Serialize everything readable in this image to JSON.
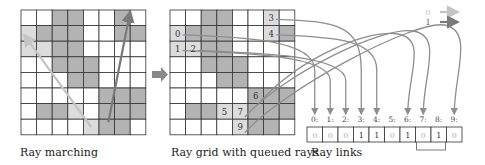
{
  "colors": {
    "cell_empty": "#ffffff",
    "cell_filled": "#b3b3b3",
    "cell_light": "#dcdcdc",
    "cell_dark": "#a8a8a8",
    "grid_line": "#333333",
    "ray0": "#c4c4c4",
    "ray1": "#7a7a7a",
    "link_line": "#8e8e8e"
  },
  "panels": {
    "ray_marching": {
      "caption": "Ray marching",
      "fill": [
        [
          0,
          0,
          1,
          1,
          0,
          0,
          1,
          0
        ],
        [
          2,
          1,
          1,
          1,
          0,
          0,
          1,
          1
        ],
        [
          2,
          2,
          1,
          1,
          0,
          0,
          0,
          0
        ],
        [
          0,
          0,
          1,
          1,
          1,
          0,
          0,
          0
        ],
        [
          0,
          0,
          0,
          1,
          1,
          0,
          0,
          0
        ],
        [
          0,
          0,
          0,
          0,
          0,
          1,
          1,
          1
        ],
        [
          0,
          1,
          1,
          2,
          0,
          1,
          1,
          1
        ],
        [
          0,
          0,
          0,
          0,
          2,
          1,
          1,
          0
        ]
      ],
      "rays": [
        {
          "type": 0,
          "from": [
            4.5,
            7.5
          ],
          "to": [
            0.2,
            1.6
          ]
        },
        {
          "type": 1,
          "from": [
            5.6,
            7.2
          ],
          "to": [
            7.0,
            0.1
          ]
        }
      ]
    },
    "ray_grid": {
      "caption": "Ray grid with queued rays",
      "fill": [
        [
          0,
          0,
          1,
          1,
          0,
          0,
          2,
          0
        ],
        [
          2,
          1,
          1,
          1,
          0,
          0,
          2,
          1
        ],
        [
          2,
          2,
          1,
          1,
          0,
          0,
          0,
          0
        ],
        [
          0,
          0,
          1,
          1,
          1,
          0,
          0,
          0
        ],
        [
          0,
          0,
          0,
          1,
          1,
          0,
          0,
          0
        ],
        [
          0,
          0,
          0,
          0,
          0,
          1,
          1,
          1
        ],
        [
          0,
          1,
          1,
          2,
          2,
          1,
          1,
          1
        ],
        [
          0,
          0,
          0,
          0,
          2,
          1,
          1,
          0
        ]
      ],
      "queued": [
        {
          "id": "0",
          "cell": [
            0,
            1
          ]
        },
        {
          "id": "1",
          "cell": [
            0,
            2
          ]
        },
        {
          "id": "2",
          "cell": [
            1,
            2
          ]
        },
        {
          "id": "3",
          "cell": [
            6,
            0
          ]
        },
        {
          "id": "4",
          "cell": [
            6,
            1
          ]
        },
        {
          "id": "5",
          "cell": [
            3,
            6
          ]
        },
        {
          "id": "6",
          "cell": [
            5,
            5
          ]
        },
        {
          "id": "7",
          "cell": [
            4,
            6
          ]
        },
        {
          "id": "9",
          "cell": [
            4,
            7
          ]
        }
      ]
    },
    "ray_links": {
      "caption": "Ray links",
      "indices": [
        "0:",
        "1:",
        "2:",
        "3:",
        "4:",
        "5:",
        "6:",
        "7:",
        "8:",
        "9:"
      ],
      "values": [
        "0",
        "0",
        "0",
        "1",
        "1",
        "0",
        "1",
        "0",
        "1",
        "0"
      ],
      "bracket": [
        7,
        8
      ]
    }
  },
  "legend": [
    {
      "label": "0",
      "type": 0
    },
    {
      "label": "1",
      "type": 1
    }
  ],
  "transition_arrow": "right-arrow"
}
